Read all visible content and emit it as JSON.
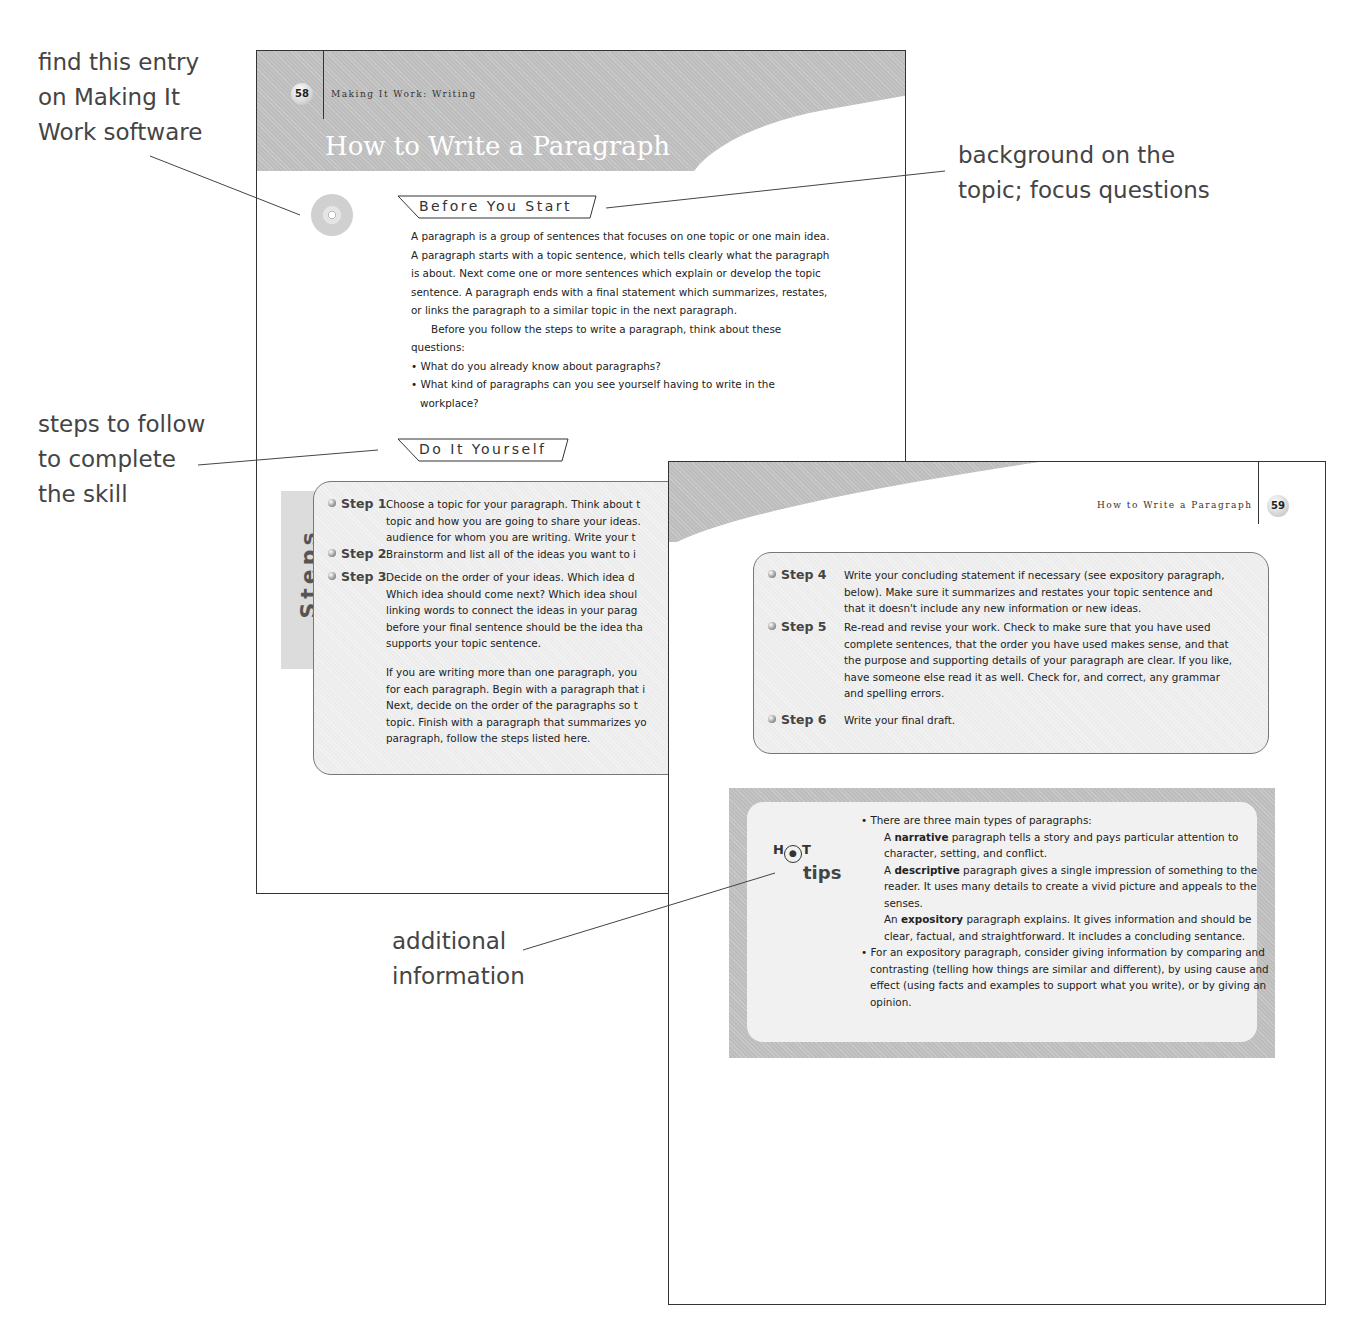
{
  "callouts": {
    "software": "find this entry\non Making It\nWork software",
    "background": "background on the\ntopic; focus questions",
    "steps": "steps to follow\nto complete\nthe skill",
    "additional": "additional\ninformation"
  },
  "page58": {
    "page_number": "58",
    "running_head": "Making It Work: Writing",
    "title": "How to Write a Paragraph",
    "cd_icon": "cd-rom-icon",
    "before_label": "Before You Start",
    "intro_paragraphs": [
      "A paragraph is a group of sentences that focuses on one topic or one main idea. A paragraph starts with a topic sentence, which tells clearly what the paragraph is about. Next come one or more sentences which explain or develop the topic sentence. A paragraph ends with a final statement which summarizes, restates, or links the paragraph to a similar topic in the next paragraph.",
      "Before you follow the steps to write a paragraph, think about these questions:"
    ],
    "questions": [
      "• What do you already know about paragraphs?",
      "• What kind of paragraphs can you see yourself having to write in the workplace?"
    ],
    "do_it_label": "Do It Yourself",
    "steps_tab": "Steps",
    "steps": [
      {
        "label": "Step 1",
        "text": "Choose a topic for your paragraph. Think about t\ntopic and how you are going to share your ideas.\naudience for whom you are writing. Write your t"
      },
      {
        "label": "Step 2",
        "text": "Brainstorm and list all of the ideas you want to i"
      },
      {
        "label": "Step 3",
        "text": "Decide on the order of your ideas. Which idea d\nWhich idea should come next? Which idea shoul\nlinking words to connect the ideas in your parag\nbefore your final sentence should be the idea tha\nsupports your topic sentence."
      }
    ],
    "steps_note": "If you are writing more than one paragraph, you\nfor each paragraph. Begin with a paragraph that i\nNext, decide on the order of the paragraphs so t\ntopic. Finish with a paragraph that summarizes yo\nparagraph, follow the steps listed here."
  },
  "page59": {
    "page_number": "59",
    "running_head": "How to Write a Paragraph",
    "steps": [
      {
        "label": "Step 4",
        "text": "Write your concluding statement if necessary (see expository paragraph,\nbelow). Make sure it summarizes and restates your topic sentence and\nthat it doesn't include any new information or new ideas."
      },
      {
        "label": "Step 5",
        "text": "Re-read and revise your work. Check to make sure that you have used\ncomplete sentences, that the order you have used makes sense, and that\nthe purpose and supporting details of your paragraph are clear. If you like,\nhave someone else read it as well. Check for, and correct, any grammar\nand spelling errors."
      },
      {
        "label": "Step 6",
        "text": "Write your final draft."
      }
    ],
    "hot_tips": {
      "hot_label_h": "H",
      "hot_label_t": "T",
      "tips_label": "tips",
      "bullet1": "• There are three main types of paragraphs:",
      "narrative_pre": "A ",
      "narrative_term": "narrative",
      "narrative_post": " paragraph tells a story and pays particular attention to character, setting, and conflict.",
      "descriptive_pre": "A ",
      "descriptive_term": "descriptive",
      "descriptive_post": " paragraph gives a single impression of something to the reader. It uses many details to create a vivid picture and appeals to the senses.",
      "expository_pre": "An ",
      "expository_term": "expository",
      "expository_post": " paragraph explains. It gives information and should be clear, factual, and straightforward. It includes a concluding sentance.",
      "bullet2": "• For an expository paragraph, consider giving information by comparing and contrasting (telling how things are similar and different), by using cause and effect (using facts and examples to support what you write), or by giving an opinion."
    }
  }
}
